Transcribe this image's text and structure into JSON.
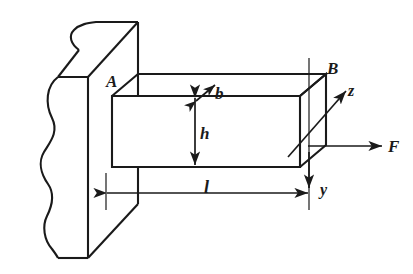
{
  "figure": {
    "background_color": "#ffffff",
    "line_color": "#1a1a1a",
    "labels": {
      "point_a": "A",
      "point_b": "B",
      "width": "b",
      "height": "h",
      "length": "l",
      "axis_z": "z",
      "axis_y": "y",
      "force": "F"
    },
    "geometry": {
      "wall": {
        "name": "broken-away-wall",
        "right_edge_x": 138,
        "front_face_left_x": 58,
        "top_y": 22,
        "bottom_y": 258
      },
      "beam": {
        "name": "cantilever-beam",
        "front_face": {
          "left_x": 112,
          "right_x": 300,
          "top_y": 96,
          "bottom_y": 167
        },
        "depth_offset": {
          "dx": 26,
          "dy": -22
        }
      },
      "dimension_l": {
        "y": 193,
        "from_x": 106,
        "to_x": 309
      },
      "dimension_h": {
        "x": 195,
        "from_y": 97,
        "to_y": 166
      },
      "dimension_b": {
        "from_x": 196,
        "from_y": 101,
        "to_x": 214,
        "to_y": 86
      },
      "force_arrow": {
        "from_x": 308,
        "from_y": 146,
        "to_x": 381,
        "to_y": 146
      },
      "axis_z": {
        "from_x": 291,
        "from_y": 154,
        "to_x": 345,
        "to_y": 92
      },
      "axis_y": {
        "from_x": 309,
        "from_y": 155,
        "to_x": 309,
        "to_y": 188
      }
    }
  }
}
